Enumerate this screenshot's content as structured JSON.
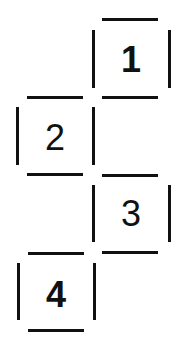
{
  "diagram": {
    "line_color": "#111111",
    "background": "#ffffff",
    "cells": [
      {
        "label": "1",
        "column": "right",
        "row": 1,
        "weight": "bold"
      },
      {
        "label": "2",
        "column": "left",
        "row": 2,
        "weight": "normal"
      },
      {
        "label": "3",
        "column": "right",
        "row": 3,
        "weight": "normal"
      },
      {
        "label": "4",
        "column": "left",
        "row": 4,
        "weight": "bold"
      }
    ]
  }
}
